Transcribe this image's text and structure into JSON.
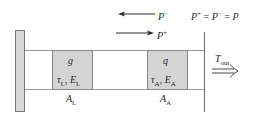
{
  "diagram": {
    "type": "laser-cavity-schematic",
    "colors": {
      "wall_fill": "#d8d8d8",
      "wall_stroke": "#777777",
      "box_fill": "#d4d4d4",
      "box_stroke": "#888888",
      "line": "#888888",
      "text": "#2a2a2a"
    },
    "arrows": {
      "backward": {
        "symbol": "P",
        "sup": "−",
        "direction": "left"
      },
      "forward": {
        "symbol": "P",
        "sup": "+",
        "direction": "right"
      }
    },
    "equation": {
      "lhs": "P",
      "lhs_sup": "+",
      "eq1": " = ",
      "mid": "P",
      "mid_sup": "−",
      "eq2": " = ",
      "rhs": "P"
    },
    "sections": [
      {
        "id": "gain",
        "top_label": "g",
        "tau": "τ",
        "tau_sub": "L",
        "sep": ", ",
        "energy": "E",
        "energy_sub": "L",
        "area": "A",
        "area_sub": "L"
      },
      {
        "id": "absorber",
        "top_label": "q",
        "tau": "τ",
        "tau_sub": "A",
        "sep": ", ",
        "energy": "E",
        "energy_sub": "A",
        "area": "A",
        "area_sub": "A"
      }
    ],
    "output": {
      "symbol": "T",
      "sub": "out",
      "arrow": "double-right-arrow"
    }
  }
}
